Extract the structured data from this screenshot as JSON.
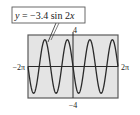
{
  "chart_data": {
    "type": "line",
    "title": "y = −3.4 sin 2x",
    "equation": {
      "prefix": "y = −3.4 sin 2",
      "variable": "x"
    },
    "function": {
      "amplitude": -3.4,
      "frequency": 2
    },
    "xlim": [
      -6.283185307,
      6.283185307
    ],
    "ylim": [
      -4,
      4
    ],
    "tick_labels": {
      "xmin": "−2π",
      "xmax": "2π",
      "ymax": "4",
      "ymin": "−4"
    },
    "grid": false,
    "legend": "callout label with pointer to curve",
    "colors": {
      "plot_background": "#e4e4e4",
      "curve": "#2a2a2a",
      "frame": "#5a5a5a",
      "axes": "#2a2a2a"
    }
  }
}
